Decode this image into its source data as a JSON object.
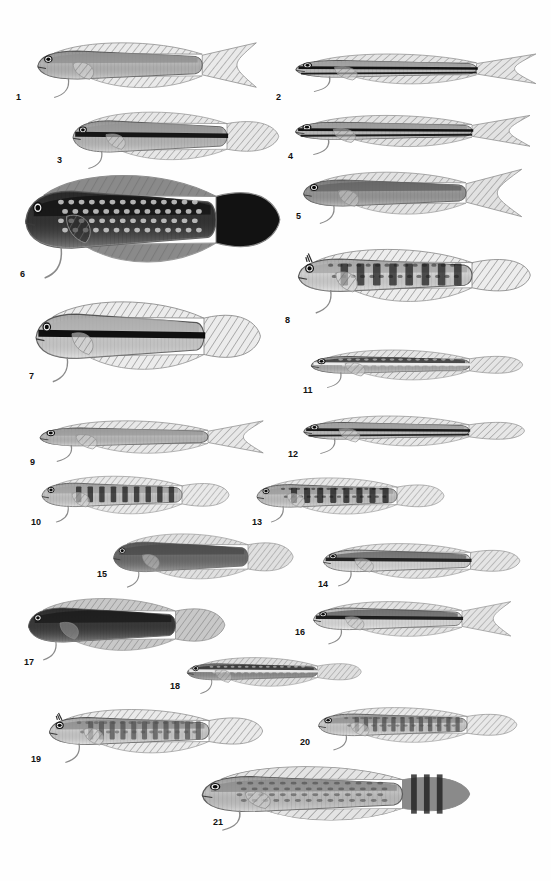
{
  "plate": {
    "title": "Fish identification plate",
    "description": "Plate of 21 numbered grayscale scientific illustrations of blenniiform and dottyback fishes, shown in lateral view, arranged in a staggered two-column layout on a white background.",
    "background_color": "#ffffff",
    "ink_color": "#111111",
    "specimen_count": 21
  },
  "specimens": [
    {
      "number": "1",
      "label_x": 16,
      "label_y": 93,
      "x": 26,
      "y": 33,
      "w": 235,
      "h": 62,
      "flip": false,
      "body_shape": "elongate-dottyback",
      "pattern": "plain-pale-body-with-black-dorsal-margin",
      "body_light": "#b9b9b9",
      "body_dark": "#8f8f8f",
      "fin_tone": "#d8d8d8",
      "accent": "#0d0d0d",
      "tail": "lunate-pale",
      "stripes": 0,
      "bars": 0,
      "spotted": false
    },
    {
      "number": "2",
      "label_x": 276,
      "label_y": 93,
      "x": 283,
      "y": 44,
      "w": 258,
      "h": 48,
      "flip": false,
      "body_shape": "slender-striped",
      "pattern": "two-black-longitudinal-stripes",
      "body_light": "#c6c6c6",
      "body_dark": "#9e9e9e",
      "fin_tone": "#cfcfcf",
      "accent": "#0a0a0a",
      "tail": "forked-pale",
      "stripes": 2,
      "bars": 0,
      "spotted": false
    },
    {
      "number": "3",
      "label_x": 57,
      "label_y": 156,
      "x": 62,
      "y": 108,
      "w": 220,
      "h": 55,
      "flip": false,
      "body_shape": "robust-dottyback",
      "pattern": "pale-body-with-black-dorsal-stripe",
      "body_light": "#bdbdbd",
      "body_dark": "#949494",
      "fin_tone": "#d2d2d2",
      "accent": "#101010",
      "tail": "rounded-grey",
      "stripes": 1,
      "bars": 0,
      "spotted": false
    },
    {
      "number": "4",
      "label_x": 288,
      "label_y": 152,
      "x": 283,
      "y": 105,
      "w": 252,
      "h": 50,
      "flip": false,
      "body_shape": "slender-striped",
      "pattern": "black-midlateral-stripe-with-white-tail",
      "body_light": "#c2c2c2",
      "body_dark": "#9a9a9a",
      "fin_tone": "#cccccc",
      "accent": "#0a0a0a",
      "tail": "lyre-white",
      "stripes": 2,
      "bars": 0,
      "spotted": false
    },
    {
      "number": "5",
      "label_x": 296,
      "label_y": 212,
      "x": 292,
      "y": 163,
      "w": 232,
      "h": 58,
      "flip": false,
      "body_shape": "dottyback-long-tail",
      "pattern": "dark-forebody-pale-hindbody",
      "body_light": "#9a9a9a",
      "body_dark": "#606060",
      "fin_tone": "#c9c9c9",
      "accent": "#141414",
      "tail": "long-filamentous",
      "stripes": 0,
      "bars": 0,
      "spotted": false
    },
    {
      "number": "6",
      "label_x": 20,
      "label_y": 270,
      "x": 12,
      "y": 168,
      "w": 272,
      "h": 100,
      "flip": false,
      "body_shape": "deep-bodied-blenny",
      "pattern": "very-dark-with-pale-spots",
      "body_light": "#343434",
      "body_dark": "#121212",
      "fin_tone": "#2a2a2a",
      "accent": "#cfcfcf",
      "tail": "rounded-dark",
      "stripes": 0,
      "bars": 0,
      "spotted": true
    },
    {
      "number": "7",
      "label_x": 29,
      "label_y": 372,
      "x": 24,
      "y": 296,
      "w": 240,
      "h": 78,
      "flip": false,
      "body_shape": "deep-bodied-pale",
      "pattern": "pale-body-with-bold-black-midlateral-stripe",
      "body_light": "#d2d2d2",
      "body_dark": "#aeaeae",
      "fin_tone": "#dcdcdc",
      "accent": "#080808",
      "tail": "rounded-pale",
      "stripes": 1,
      "bars": 0,
      "spotted": false
    },
    {
      "number": "8",
      "label_x": 285,
      "label_y": 316,
      "x": 286,
      "y": 238,
      "w": 248,
      "h": 72,
      "flip": false,
      "body_shape": "blenny-with-cirri",
      "pattern": "rows-of-dark-blotches-on-pale-body",
      "body_light": "#d6d6d6",
      "body_dark": "#a6a6a6",
      "fin_tone": "#dddddd",
      "accent": "#1a1a1a",
      "tail": "rounded-striated",
      "stripes": 0,
      "bars": 8,
      "spotted": true
    },
    {
      "number": "11",
      "label_x": 303,
      "label_y": 386,
      "x": 300,
      "y": 340,
      "w": 226,
      "h": 48,
      "flip": false,
      "body_shape": "slender-blenny",
      "pattern": "dark-band-with-white-dashes",
      "body_light": "#b0b0b0",
      "body_dark": "#2e2e2e",
      "fin_tone": "#cfcfcf",
      "accent": "#f0f0f0",
      "tail": "pale-fan",
      "stripes": 1,
      "bars": 0,
      "spotted": true
    },
    {
      "number": "9",
      "label_x": 30,
      "label_y": 458,
      "x": 28,
      "y": 410,
      "w": 240,
      "h": 52,
      "flip": false,
      "body_shape": "plain-elongate",
      "pattern": "uniform-pale-grey",
      "body_light": "#bdbdbd",
      "body_dark": "#9b9b9b",
      "fin_tone": "#d4d4d4",
      "accent": "#6e6e6e",
      "tail": "lunate-pale",
      "stripes": 0,
      "bars": 0,
      "spotted": false
    },
    {
      "number": "12",
      "label_x": 288,
      "label_y": 450,
      "x": 292,
      "y": 406,
      "w": 236,
      "h": 48,
      "flip": false,
      "body_shape": "slender-striped",
      "pattern": "two-narrow-dark-stripes",
      "body_light": "#c4c4c4",
      "body_dark": "#9d9d9d",
      "fin_tone": "#d2d2d2",
      "accent": "#121212",
      "tail": "pale-fan",
      "stripes": 2,
      "bars": 0,
      "spotted": false
    },
    {
      "number": "10",
      "label_x": 31,
      "label_y": 518,
      "x": 32,
      "y": 468,
      "w": 200,
      "h": 52,
      "flip": false,
      "body_shape": "barred-blenny",
      "pattern": "vertical-dark-bars",
      "body_light": "#c9c9c9",
      "body_dark": "#9f9f9f",
      "fin_tone": "#d6d6d6",
      "accent": "#161616",
      "tail": "rounded-pale",
      "stripes": 0,
      "bars": 9,
      "spotted": false
    },
    {
      "number": "13",
      "label_x": 252,
      "label_y": 518,
      "x": 247,
      "y": 470,
      "w": 200,
      "h": 50,
      "flip": false,
      "body_shape": "blotched-blenny",
      "pattern": "double-row-of-dark-blotches",
      "body_light": "#c6c6c6",
      "body_dark": "#9a9a9a",
      "fin_tone": "#d4d4d4",
      "accent": "#141414",
      "tail": "pale-fan",
      "stripes": 0,
      "bars": 8,
      "spotted": true
    },
    {
      "number": "15",
      "label_x": 97,
      "label_y": 570,
      "x": 104,
      "y": 530,
      "w": 192,
      "h": 52,
      "flip": false,
      "body_shape": "stout-dottyback",
      "pattern": "uniform-dark-grey",
      "body_light": "#6d6d6d",
      "body_dark": "#4a4a4a",
      "fin_tone": "#c6c6c6",
      "accent": "#232323",
      "tail": "pale-fan",
      "stripes": 0,
      "bars": 0,
      "spotted": false
    },
    {
      "number": "14",
      "label_x": 318,
      "label_y": 580,
      "x": 313,
      "y": 536,
      "w": 210,
      "h": 48,
      "flip": false,
      "body_shape": "bicolor-dottyback",
      "pattern": "dark-dorsum-pale-belly",
      "body_light": "#dcdcdc",
      "body_dark": "#5e5e5e",
      "fin_tone": "#cfcfcf",
      "accent": "#1c1c1c",
      "tail": "pale-fan",
      "stripes": 1,
      "bars": 0,
      "spotted": false
    },
    {
      "number": "17",
      "label_x": 24,
      "label_y": 658,
      "x": 18,
      "y": 594,
      "w": 210,
      "h": 60,
      "flip": false,
      "body_shape": "stout-dark-blenny",
      "pattern": "very-dark-overall",
      "body_light": "#3a3a3a",
      "body_dark": "#1a1a1a",
      "fin_tone": "#9a9a9a",
      "accent": "#0a0a0a",
      "tail": "pale-fan",
      "stripes": 0,
      "bars": 0,
      "spotted": false
    },
    {
      "number": "16",
      "label_x": 295,
      "label_y": 628,
      "x": 303,
      "y": 594,
      "w": 212,
      "h": 48,
      "flip": false,
      "body_shape": "bicolor-dottyback",
      "pattern": "dark-dorsum-white-belly",
      "body_light": "#e2e2e2",
      "body_dark": "#585858",
      "fin_tone": "#cccccc",
      "accent": "#171717",
      "tail": "forked-pale",
      "stripes": 1,
      "bars": 0,
      "spotted": false
    },
    {
      "number": "18",
      "label_x": 170,
      "label_y": 682,
      "x": 178,
      "y": 648,
      "w": 186,
      "h": 46,
      "flip": false,
      "body_shape": "slender-dark-blenny",
      "pattern": "dark-body-with-white-dashes-and-spots",
      "body_light": "#8c8c8c",
      "body_dark": "#2b2b2b",
      "fin_tone": "#c4c4c4",
      "accent": "#ececec",
      "tail": "pale-fan",
      "stripes": 1,
      "bars": 0,
      "spotted": true
    },
    {
      "number": "19",
      "label_x": 31,
      "label_y": 755,
      "x": 38,
      "y": 700,
      "w": 228,
      "h": 60,
      "flip": false,
      "body_shape": "barred-blenny-with-cirri",
      "pattern": "bold-vertical-bars-pale-head",
      "body_light": "#d0d0d0",
      "body_dark": "#8a8a8a",
      "fin_tone": "#d8d8d8",
      "accent": "#4d4d4d",
      "tail": "pale-fan",
      "stripes": 0,
      "bars": 11,
      "spotted": true
    },
    {
      "number": "20",
      "label_x": 300,
      "label_y": 738,
      "x": 308,
      "y": 700,
      "w": 212,
      "h": 48,
      "flip": false,
      "body_shape": "barred-blenny",
      "pattern": "narrow-vertical-bars-pale-head",
      "body_light": "#cecece",
      "body_dark": "#8c8c8c",
      "fin_tone": "#d6d6d6",
      "accent": "#4a4a4a",
      "tail": "pale-fan",
      "stripes": 0,
      "bars": 12,
      "spotted": true
    },
    {
      "number": "21",
      "label_x": 213,
      "label_y": 818,
      "x": 188,
      "y": 762,
      "w": 286,
      "h": 62,
      "flip": false,
      "body_shape": "robust-mottled-blenny",
      "pattern": "mottled-marbled-with-banded-tail",
      "body_light": "#c4c4c4",
      "body_dark": "#8a8a8a",
      "fin_tone": "#cdcdcd",
      "accent": "#3a3a3a",
      "tail": "banded-dark",
      "stripes": 0,
      "bars": 0,
      "spotted": true
    }
  ]
}
